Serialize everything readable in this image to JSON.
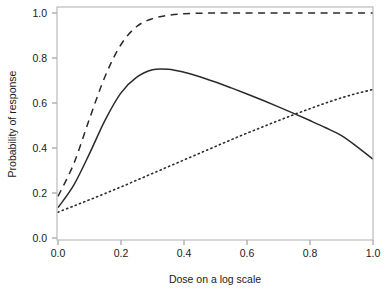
{
  "chart_data": {
    "type": "line",
    "title": "",
    "xlabel": "Dose on a log scale",
    "ylabel": "Probability of response",
    "xlim": [
      0.0,
      1.04
    ],
    "ylim": [
      -0.02,
      1.04
    ],
    "grid": false,
    "legend": "none",
    "box": true,
    "xticks": [
      0.0,
      0.2,
      0.4,
      0.6,
      0.8,
      1.0
    ],
    "xticklabels": [
      "0.0",
      "0.2",
      "0.4",
      "0.6",
      "0.8",
      "1.0"
    ],
    "yticks": [
      0.0,
      0.2,
      0.4,
      0.6,
      0.8,
      1.0
    ],
    "yticklabels": [
      "0.0",
      "0.2",
      "0.4",
      "0.6",
      "0.8",
      "1.0"
    ],
    "x": [
      0.0,
      0.05,
      0.1,
      0.15,
      0.2,
      0.25,
      0.3,
      0.35,
      0.4,
      0.45,
      0.5,
      0.55,
      0.6,
      0.65,
      0.7,
      0.75,
      0.8,
      0.85,
      0.9,
      0.95,
      1.0
    ],
    "series": [
      {
        "name": "solid-curve",
        "style": "solid",
        "color": "#2a2a2a",
        "width": 1.5,
        "values": [
          0.135,
          0.235,
          0.375,
          0.525,
          0.645,
          0.715,
          0.748,
          0.75,
          0.737,
          0.717,
          0.693,
          0.667,
          0.64,
          0.612,
          0.583,
          0.553,
          0.522,
          0.49,
          0.455,
          0.405,
          0.35
        ]
      },
      {
        "name": "dashed-curve",
        "style": "dashed",
        "color": "#2a2a2a",
        "width": 1.5,
        "values": [
          0.185,
          0.33,
          0.53,
          0.72,
          0.86,
          0.94,
          0.975,
          0.99,
          0.997,
          0.999,
          1.0,
          1.0,
          1.0,
          1.0,
          1.0,
          1.0,
          1.0,
          1.0,
          1.0,
          1.0,
          1.0
        ]
      },
      {
        "name": "dotted-line",
        "style": "dotted",
        "color": "#2a2a2a",
        "width": 1.6,
        "values": [
          0.115,
          0.142,
          0.17,
          0.198,
          0.227,
          0.257,
          0.287,
          0.317,
          0.347,
          0.377,
          0.407,
          0.437,
          0.466,
          0.494,
          0.522,
          0.549,
          0.575,
          0.6,
          0.623,
          0.643,
          0.66
        ]
      }
    ],
    "annotations": []
  },
  "axes": {
    "x_title": "Dose on a log scale",
    "y_title": "Probability of response"
  }
}
